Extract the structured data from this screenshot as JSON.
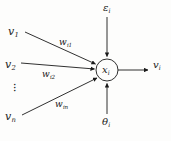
{
  "figure": {
    "stroke_color": "#1a1a1a",
    "background_color": "#fdfdfc",
    "node": {
      "label_base": "x",
      "label_sub": "i",
      "cx": 107,
      "cy": 70,
      "r": 11
    },
    "inputs": [
      {
        "id": "v1",
        "base": "v",
        "sub": "1",
        "x": 8,
        "y": 26
      },
      {
        "id": "v2",
        "base": "v",
        "sub": "2",
        "x": 5,
        "y": 59
      },
      {
        "id": "vn",
        "base": "v",
        "sub": "n",
        "x": 5,
        "y": 111
      }
    ],
    "ellipsis": {
      "glyph": "·",
      "count": 3,
      "x": 14,
      "y": 84
    },
    "weights": [
      {
        "id": "wi1",
        "base": "w",
        "sub": "i1",
        "x": 59,
        "y": 38
      },
      {
        "id": "wi2",
        "base": "w",
        "sub": "i2",
        "x": 42,
        "y": 70
      },
      {
        "id": "win",
        "base": "w",
        "sub": "in",
        "x": 55,
        "y": 100
      }
    ],
    "top_input": {
      "id": "epsilon_i",
      "base": "ε",
      "sub": "i",
      "x": 103,
      "y": 3
    },
    "bottom_input": {
      "id": "theta_i",
      "base": "θ",
      "sub": "i",
      "x": 102,
      "y": 117
    },
    "output": {
      "id": "v_i",
      "base": "v",
      "sub": "i",
      "x": 153,
      "y": 60
    }
  }
}
